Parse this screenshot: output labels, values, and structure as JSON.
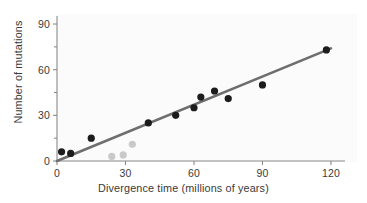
{
  "chart_data": {
    "type": "scatter",
    "title": "",
    "xlabel": "Divergence time (millions of years)",
    "ylabel": "Number of mutations",
    "xlim": [
      0,
      125
    ],
    "ylim": [
      0,
      95
    ],
    "xticks": [
      0,
      30,
      60,
      90,
      120
    ],
    "yticks": [
      0,
      30,
      60,
      90
    ],
    "xtick_labels": [
      "0",
      "30",
      "60",
      "90",
      "120"
    ],
    "ytick_labels": [
      "0",
      "30",
      "60",
      "90"
    ],
    "grid": false,
    "legend": null,
    "series": [
      {
        "name": "primary-samples",
        "marker": "filled-circle",
        "color": "#1c1c1c",
        "points": [
          {
            "x": 2,
            "y": 6
          },
          {
            "x": 6,
            "y": 5
          },
          {
            "x": 15,
            "y": 15
          },
          {
            "x": 40,
            "y": 25
          },
          {
            "x": 52,
            "y": 30
          },
          {
            "x": 60,
            "y": 35
          },
          {
            "x": 63,
            "y": 42
          },
          {
            "x": 69,
            "y": 46
          },
          {
            "x": 75,
            "y": 41
          },
          {
            "x": 90,
            "y": 50
          },
          {
            "x": 118,
            "y": 73
          }
        ]
      },
      {
        "name": "outlier-samples",
        "marker": "filled-circle",
        "color": "#c9c9c9",
        "points": [
          {
            "x": 24,
            "y": 3
          },
          {
            "x": 29,
            "y": 4
          },
          {
            "x": 33,
            "y": 11
          }
        ]
      }
    ],
    "trendline": {
      "name": "regression-line",
      "color": "#6e6e6e",
      "x_start": 0,
      "y_start": 0,
      "x_end": 120,
      "y_end": 74
    }
  },
  "axis_colors": {
    "axis": "#8a8a8a",
    "text": "#3a3a3a",
    "background": "#ffffff"
  }
}
